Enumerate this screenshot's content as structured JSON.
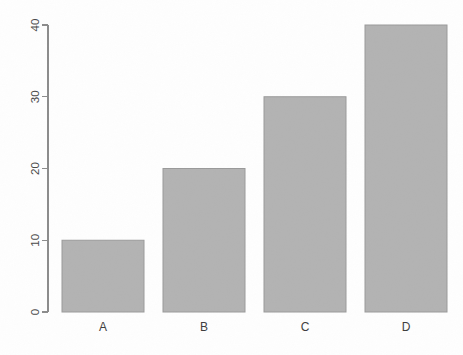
{
  "chart_data": {
    "type": "bar",
    "title": "",
    "subtitle": "",
    "xlabel": "",
    "ylabel": "",
    "categories": [
      "A",
      "B",
      "C",
      "D"
    ],
    "values": [
      10,
      20,
      30,
      40
    ],
    "series": [
      {
        "name": "",
        "values": [
          10,
          20,
          30,
          40
        ]
      }
    ],
    "ylim": [
      0,
      40
    ],
    "y_ticks": [
      0,
      10,
      20,
      30,
      40
    ],
    "y_tick_labels": [
      "0",
      "10",
      "20",
      "30",
      "40"
    ],
    "x_tick_labels": [
      "A",
      "B",
      "C",
      "D"
    ],
    "grid": false,
    "legend": false,
    "legend_position": "none",
    "annotations": [],
    "bar_fill_color": "#b3b3b3",
    "bar_border_color": "#9a9a9a",
    "axis_color": "#8c8c8c",
    "background_color": "#fefefe",
    "tick_label_color": "#4a4a4a",
    "y_axis_label_rotation_deg": 90,
    "bar_count": 4
  },
  "geometry": {
    "canvas_width": 463,
    "canvas_height": 355,
    "axis_x": 48,
    "axis_top_y": 25,
    "axis_bottom_y": 312,
    "tick_length": 6,
    "bar_width": 82,
    "bar_left_positions": [
      62,
      163,
      264,
      365
    ],
    "bar_top_positions": [
      240,
      168,
      97,
      25
    ],
    "x_label_y": 331,
    "y_tick_y_positions": [
      312,
      240,
      169,
      97,
      25
    ]
  }
}
